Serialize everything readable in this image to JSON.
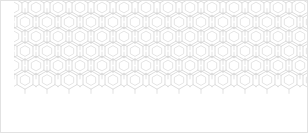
{
  "swatch": {
    "title": "Hexagon Lattice Pattern Swatch",
    "caption": "",
    "background_color": "#ffffff",
    "border_color": "#e2e2e2",
    "canvas_width": 308,
    "canvas_height": 133
  },
  "pattern": {
    "name": "nested-hexagon-lattice",
    "motif": "hexagon-with-inner-hexagon",
    "line_color": "#cfcfcf",
    "inner_line_color": "#d8d8d8",
    "stem_line_color": "#d4d4d4",
    "line_width": 0.7,
    "tile_width": 22,
    "tile_height": 29,
    "columns": 15,
    "rows": 6,
    "offset_x": 14,
    "offset_y": -7,
    "outer_radius": 9.2,
    "inner_radius": 5.4,
    "stem_length": 4.2,
    "orientation": "pointy-top",
    "fill": "none"
  },
  "render": {
    "surface_left": 14,
    "surface_top": -7,
    "surface_width": 330,
    "surface_height": 181
  }
}
